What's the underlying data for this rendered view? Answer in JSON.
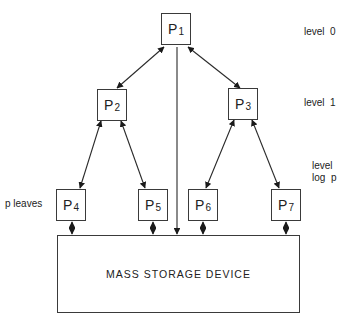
{
  "diagram": {
    "nodes": [
      {
        "id": "P1",
        "letter": "P",
        "sub": "1",
        "level": 0
      },
      {
        "id": "P2",
        "letter": "P",
        "sub": "2",
        "level": 1
      },
      {
        "id": "P3",
        "letter": "P",
        "sub": "3",
        "level": 1
      },
      {
        "id": "P4",
        "letter": "P",
        "sub": "4",
        "level": "log p"
      },
      {
        "id": "P5",
        "letter": "P",
        "sub": "5",
        "level": "log p"
      },
      {
        "id": "P6",
        "letter": "P",
        "sub": "6",
        "level": "log p"
      },
      {
        "id": "P7",
        "letter": "P",
        "sub": "7",
        "level": "log p"
      }
    ],
    "edges": [
      {
        "from": "P1",
        "to": "P2",
        "type": "bidirectional"
      },
      {
        "from": "P1",
        "to": "P3",
        "type": "bidirectional"
      },
      {
        "from": "P2",
        "to": "P4",
        "type": "bidirectional"
      },
      {
        "from": "P2",
        "to": "P5",
        "type": "bidirectional"
      },
      {
        "from": "P3",
        "to": "P6",
        "type": "bidirectional"
      },
      {
        "from": "P3",
        "to": "P7",
        "type": "bidirectional"
      },
      {
        "from": "P1",
        "to": "storage",
        "type": "directed"
      },
      {
        "from": "P4",
        "to": "storage",
        "type": "bidirectional"
      },
      {
        "from": "P5",
        "to": "storage",
        "type": "bidirectional"
      },
      {
        "from": "P6",
        "to": "storage",
        "type": "bidirectional"
      },
      {
        "from": "P7",
        "to": "storage",
        "type": "bidirectional"
      }
    ],
    "storage_label": "MASS STORAGE DEVICE",
    "level_labels": {
      "level0": "level  0",
      "level1": "level  1",
      "level_last_line1": "level",
      "level_last_line2": "log  p"
    },
    "leaves_label": "p leaves"
  }
}
